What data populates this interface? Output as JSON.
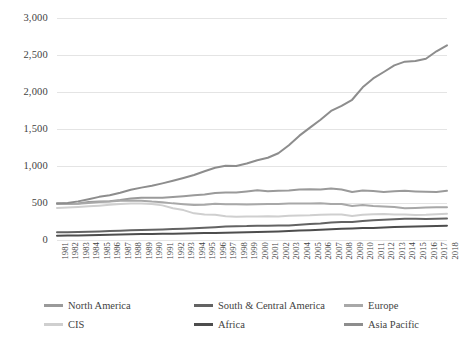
{
  "chart_data": {
    "type": "line",
    "title": "",
    "subtitle": "",
    "xlabel": "",
    "ylabel": "",
    "ylim": [
      0,
      3000
    ],
    "ytick_labels": [
      "0",
      "500",
      "1,000",
      "1,500",
      "2,000",
      "2,500",
      "3,000"
    ],
    "ytick_values": [
      0,
      500,
      1000,
      1500,
      2000,
      2500,
      3000
    ],
    "grid": true,
    "grid_axis": "y",
    "legend_position": "bottom",
    "x": [
      1981,
      1982,
      1983,
      1984,
      1985,
      1986,
      1987,
      1988,
      1989,
      1990,
      1991,
      1992,
      1993,
      1994,
      1995,
      1996,
      1997,
      1998,
      1999,
      2000,
      2001,
      2002,
      2003,
      2004,
      2005,
      2006,
      2007,
      2008,
      2009,
      2010,
      2011,
      2012,
      2013,
      2014,
      2015,
      2016,
      2017,
      2018
    ],
    "categories": [
      "1981",
      "1982",
      "1983",
      "1984",
      "1985",
      "1986",
      "1987",
      "1988",
      "1989",
      "1990",
      "1991",
      "1992",
      "1993",
      "1994",
      "1995",
      "1996",
      "1997",
      "1998",
      "1999",
      "2000",
      "2001",
      "2002",
      "2003",
      "2004",
      "2005",
      "2006",
      "2007",
      "2008",
      "2009",
      "2010",
      "2011",
      "2012",
      "2013",
      "2014",
      "2015",
      "2016",
      "2017",
      "2018"
    ],
    "series": [
      {
        "name": "North America",
        "color": "#9a9a9a",
        "width": 2.0,
        "values": [
          497,
          489,
          492,
          512,
          519,
          524,
          540,
          561,
          570,
          570,
          571,
          581,
          591,
          604,
          616,
          634,
          641,
          643,
          657,
          672,
          658,
          665,
          669,
          683,
          686,
          681,
          695,
          682,
          648,
          668,
          662,
          650,
          658,
          664,
          657,
          652,
          650,
          665
        ]
      },
      {
        "name": "South & Central America",
        "color": "#636363",
        "width": 2.0,
        "values": [
          104,
          106,
          108,
          112,
          116,
          121,
          126,
          131,
          134,
          137,
          142,
          148,
          152,
          159,
          166,
          173,
          181,
          187,
          188,
          193,
          194,
          195,
          197,
          207,
          215,
          223,
          235,
          243,
          243,
          258,
          266,
          275,
          282,
          286,
          286,
          285,
          287,
          291
        ]
      },
      {
        "name": "Europe",
        "color": "#a8a8a8",
        "width": 2.0,
        "values": [
          494,
          486,
          489,
          499,
          513,
          519,
          530,
          534,
          531,
          519,
          511,
          495,
          484,
          474,
          478,
          490,
          482,
          484,
          481,
          484,
          487,
          485,
          492,
          494,
          494,
          496,
          487,
          487,
          459,
          473,
          458,
          452,
          447,
          430,
          434,
          438,
          442,
          443
        ]
      },
      {
        "name": "CIS",
        "color": "#cfcfcf",
        "width": 2.0,
        "values": [
          432,
          438,
          446,
          456,
          464,
          475,
          487,
          492,
          493,
          486,
          468,
          430,
          404,
          360,
          345,
          340,
          322,
          314,
          318,
          318,
          320,
          318,
          327,
          331,
          333,
          342,
          344,
          345,
          325,
          341,
          347,
          351,
          346,
          343,
          339,
          341,
          348,
          355
        ]
      },
      {
        "name": "Africa",
        "color": "#4d4d4d",
        "width": 2.0,
        "values": [
          57,
          60,
          62,
          65,
          68,
          71,
          74,
          77,
          80,
          82,
          84,
          86,
          88,
          90,
          93,
          96,
          99,
          102,
          104,
          108,
          112,
          115,
          121,
          127,
          133,
          138,
          146,
          152,
          155,
          161,
          161,
          170,
          175,
          179,
          182,
          186,
          190,
          194
        ]
      },
      {
        "name": "Asia Pacific",
        "color": "#8d8d8d",
        "width": 2.0,
        "values": [
          490,
          500,
          522,
          552,
          583,
          604,
          638,
          678,
          708,
          733,
          765,
          800,
          838,
          879,
          929,
          977,
          1004,
          1001,
          1034,
          1078,
          1111,
          1172,
          1281,
          1410,
          1519,
          1624,
          1744,
          1812,
          1895,
          2063,
          2183,
          2270,
          2360,
          2410,
          2420,
          2450,
          2550,
          2630
        ]
      }
    ]
  },
  "legend": {
    "items": [
      {
        "label": "North America",
        "color": "#9a9a9a"
      },
      {
        "label": "South &  Central America",
        "color": "#636363"
      },
      {
        "label": "Europe",
        "color": "#a8a8a8"
      },
      {
        "label": "CIS",
        "color": "#cfcfcf"
      },
      {
        "label": "Africa",
        "color": "#4d4d4d"
      },
      {
        "label": "Asia Pacific",
        "color": "#8d8d8d"
      }
    ]
  },
  "style": {
    "grid_color": "#e4e4e4",
    "text_color": "#3f3f3f",
    "background": "#ffffff"
  }
}
